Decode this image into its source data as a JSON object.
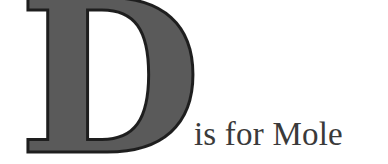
{
  "title": {
    "drop_cap": "D",
    "rest_text": "is for Mole"
  },
  "colors": {
    "drop_cap_fill": "#5a5a5a",
    "drop_cap_outline": "#1e1e1e",
    "text": "#3a3a3a",
    "background": "#ffffff"
  }
}
